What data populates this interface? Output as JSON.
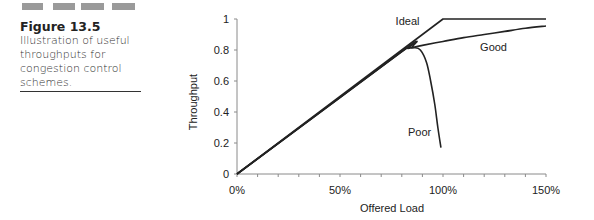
{
  "header_bars": {
    "count": 4,
    "color": "#9a9a9a"
  },
  "caption": {
    "figure_label": "Figure 13.5",
    "lines": [
      "Illustration of useful",
      "throughputs for",
      "congestion control",
      "schemes."
    ]
  },
  "chart_data": {
    "type": "line",
    "title": "",
    "xlabel": "Offered Load",
    "ylabel": "Throughput",
    "xlim": [
      0,
      150
    ],
    "ylim": [
      0,
      1
    ],
    "x_ticks": [
      "0%",
      "50%",
      "100%",
      "150%"
    ],
    "x_minor_tick_step": 10,
    "y_ticks": [
      "0",
      "0.2",
      "0.4",
      "0.6",
      "0.8",
      "1"
    ],
    "grid": false,
    "legend": "inline labels",
    "series": [
      {
        "name": "Ideal",
        "x": [
          0,
          100,
          150
        ],
        "y": [
          0,
          1,
          1
        ]
      },
      {
        "name": "Good",
        "x": [
          0,
          80,
          85,
          90,
          100,
          110,
          120,
          130,
          140,
          150
        ],
        "y": [
          0,
          0.79,
          0.815,
          0.83,
          0.855,
          0.88,
          0.9,
          0.92,
          0.94,
          0.955
        ]
      },
      {
        "name": "Poor",
        "x": [
          0,
          80,
          83,
          86,
          89,
          92,
          94,
          96,
          97.5,
          99
        ],
        "y": [
          0,
          0.79,
          0.81,
          0.815,
          0.8,
          0.72,
          0.6,
          0.45,
          0.3,
          0.17
        ]
      }
    ],
    "annotations": [
      {
        "text": "Ideal",
        "x": 77,
        "y": 0.99
      },
      {
        "text": "Good",
        "x": 118,
        "y": 0.82
      },
      {
        "text": "Poor",
        "x": 83,
        "y": 0.27
      }
    ],
    "line_color": "#222222"
  }
}
